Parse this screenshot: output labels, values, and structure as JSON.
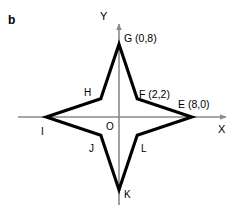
{
  "figure": {
    "panel_letter": "b",
    "background_color": "#ffffff",
    "ink_color": "#000000",
    "axis_color": "#808080",
    "width": 242,
    "height": 213
  },
  "axes": {
    "x_axis_label": "X",
    "y_axis_label": "Y",
    "origin_label": "O",
    "origin_px": {
      "x": 119,
      "y": 117
    },
    "units_per_pixel": 9.1,
    "x_range_px": {
      "start": 18,
      "end": 232
    },
    "y_range_px": {
      "start": 18,
      "end": 205
    }
  },
  "chart_data": {
    "type": "scatter",
    "title": "",
    "subtitle": "",
    "xlabel": "X",
    "ylabel": "Y",
    "grid": false,
    "legend": "none",
    "shape": "eight-pointed star polygon (four-pointed star outline)",
    "xlim": [
      -11,
      12.5
    ],
    "ylim": [
      -9.5,
      9.5
    ],
    "points": [
      {
        "name": "G",
        "label": "G (0,8)",
        "x": 0,
        "y": 8,
        "kind": "outer",
        "label_shown": true
      },
      {
        "name": "F",
        "label": "F (2,2)",
        "x": 2,
        "y": 2,
        "kind": "inner",
        "label_shown": true
      },
      {
        "name": "E",
        "label": "E (8,0)",
        "x": 8,
        "y": 0,
        "kind": "outer",
        "label_shown": true
      },
      {
        "name": "L",
        "label": "L",
        "x": 2,
        "y": -2,
        "kind": "inner",
        "label_shown": true
      },
      {
        "name": "K",
        "label": "K",
        "x": 0,
        "y": -8,
        "kind": "outer",
        "label_shown": true
      },
      {
        "name": "J",
        "label": "J",
        "x": -2,
        "y": -2,
        "kind": "inner",
        "label_shown": true
      },
      {
        "name": "I",
        "label": "I",
        "x": -8,
        "y": 0,
        "kind": "outer",
        "label_shown": true
      },
      {
        "name": "H",
        "label": "H",
        "x": -2,
        "y": 2,
        "kind": "inner",
        "label_shown": true
      }
    ],
    "polygon_order": [
      "G",
      "F",
      "E",
      "L",
      "K",
      "J",
      "I",
      "H"
    ],
    "annotations": [
      {
        "text": "O",
        "x": 0,
        "y": 0,
        "note": "origin marker label"
      },
      {
        "text": "b",
        "note": "panel identifier, top-left of figure"
      }
    ]
  },
  "labels": {
    "panel_b": "b",
    "y_axis": "Y",
    "x_axis": "X",
    "origin": "O",
    "vertex_g": "G (0,8)",
    "vertex_f": "F (2,2)",
    "vertex_e": "E (8,0)",
    "vertex_h": "H",
    "vertex_i": "I",
    "vertex_j": "J",
    "vertex_k": "K",
    "vertex_l": "L"
  }
}
